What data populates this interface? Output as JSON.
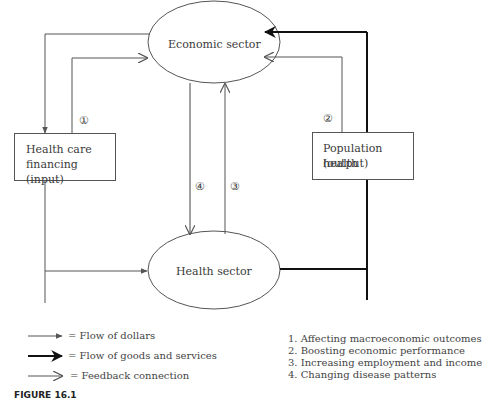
{
  "diagram": {
    "nodes": {
      "economic_sector": "Economic sector",
      "health_sector": "Health sector",
      "health_care_financing": [
        "Health care",
        "financing (input)"
      ],
      "population_health": [
        "Population health",
        "(output)"
      ]
    },
    "markers": {
      "m1": "①",
      "m2": "②",
      "m3": "③",
      "m4": "④"
    }
  },
  "legend": {
    "items": [
      {
        "icon": "thin-filled-arrow",
        "label": "= Flow of dollars"
      },
      {
        "icon": "thick-filled-arrow",
        "label": "= Flow of goods and services"
      },
      {
        "icon": "open-arrow",
        "label": "= Feedback connection"
      }
    ]
  },
  "numbered_list": [
    "1. Affecting macroeconomic outcomes",
    "2. Boosting economic performance",
    "3. Increasing employment and income",
    "4. Changing disease patterns"
  ],
  "caption": "FIGURE 16.1",
  "colors": {
    "line": "#555555",
    "thick_line": "#111111",
    "text": "#3a3a3a"
  }
}
